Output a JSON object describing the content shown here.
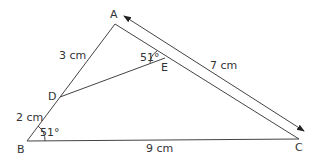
{
  "diagram": {
    "type": "geometry-triangle",
    "points": {
      "A": {
        "label": "A"
      },
      "B": {
        "label": "B"
      },
      "C": {
        "label": "C"
      },
      "D": {
        "label": "D"
      },
      "E": {
        "label": "E"
      }
    },
    "lengths": {
      "AD": "3 cm",
      "DB": "2 cm",
      "AC": "7 cm",
      "BC": "9 cm"
    },
    "angles": {
      "B": "51°",
      "AED": "51°"
    },
    "stroke_color": "#444444"
  }
}
